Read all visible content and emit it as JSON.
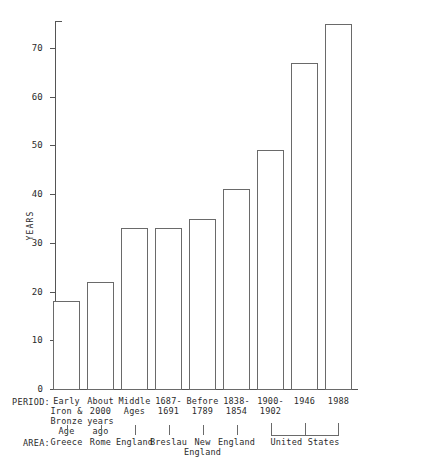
{
  "chart_data": {
    "type": "bar",
    "title": "",
    "xlabel": "",
    "ylabel": "YEARS",
    "ylim": [
      0,
      78
    ],
    "grid": false,
    "legend": null,
    "yticks": [
      "0",
      "10",
      "20",
      "30",
      "40",
      "50",
      "60",
      "70"
    ],
    "ytick_values": [
      0,
      10,
      20,
      30,
      40,
      50,
      60,
      70
    ],
    "categories": [
      "Early Iron & Bronze Age",
      "About 2000 years ago",
      "Middle Ages",
      "1687-1691",
      "Before 1789",
      "1838-1854",
      "1900-1902",
      "1946",
      "1988"
    ],
    "values": [
      18,
      22,
      33,
      33,
      35,
      41,
      49,
      67,
      75
    ],
    "bars": [
      {
        "period": "Early\nIron &\nBronze\nAge",
        "area": "Greece",
        "value": 18
      },
      {
        "period": "About\n2000\nyears\nago",
        "area": "Rome",
        "value": 22
      },
      {
        "period": "Middle\nAges",
        "area": "England",
        "value": 33
      },
      {
        "period": "1687-\n1691",
        "area": "Breslau",
        "value": 33
      },
      {
        "period": "Before\n1789",
        "area": "New\nEngland",
        "value": 35
      },
      {
        "period": "1838-\n1854",
        "area": "England",
        "value": 41
      },
      {
        "period": "1900-\n1902",
        "area": "United States",
        "value": 49
      },
      {
        "period": "1946",
        "area": "United States",
        "value": 67
      },
      {
        "period": "1988",
        "area": "United States",
        "value": 75
      }
    ],
    "groups": [
      {
        "label": "United States",
        "first_bar": 6,
        "last_bar": 8
      }
    ]
  },
  "axes": {
    "period_row_label": "PERIOD:",
    "area_row_label": "AREA:",
    "y_axis_title": "YEARS"
  },
  "colors": {
    "bar_stroke": "#6a6a6a",
    "bar_fill": "#ffffff",
    "axis": "#555555",
    "text": "#2b2b2b",
    "background": "#ffffff"
  }
}
